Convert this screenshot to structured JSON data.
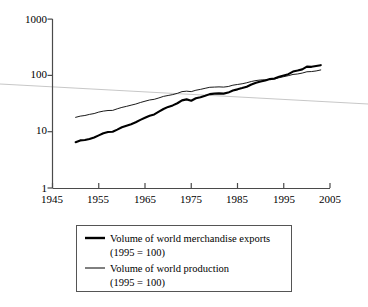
{
  "chart_data": {
    "type": "line",
    "title": "",
    "subtitle": "",
    "xlabel": "",
    "ylabel": "",
    "yscale": "log",
    "xlim": [
      1945,
      2005
    ],
    "ylim": [
      1,
      1000
    ],
    "grid": false,
    "legend_position": "bottom",
    "x_ticks": [
      "1945",
      "1955",
      "1965",
      "1975",
      "1985",
      "1995",
      "2005"
    ],
    "y_ticks": [
      "1",
      "10",
      "100",
      "1000"
    ],
    "x": [
      1950,
      1951,
      1952,
      1953,
      1954,
      1955,
      1956,
      1957,
      1958,
      1959,
      1960,
      1961,
      1962,
      1963,
      1964,
      1965,
      1966,
      1967,
      1968,
      1969,
      1970,
      1971,
      1972,
      1973,
      1974,
      1975,
      1976,
      1977,
      1978,
      1979,
      1980,
      1981,
      1982,
      1983,
      1984,
      1985,
      1986,
      1987,
      1988,
      1989,
      1990,
      1991,
      1992,
      1993,
      1994,
      1995,
      1996,
      1997,
      1998,
      1999,
      2000,
      2001,
      2002,
      2003
    ],
    "series": [
      {
        "name": "Volume of world merchandise exports (1995 = 100)",
        "style": "thick",
        "color": "#000000",
        "values": [
          6.5,
          7.0,
          7.1,
          7.4,
          7.9,
          8.6,
          9.4,
          9.9,
          10.0,
          10.9,
          12.0,
          12.8,
          13.6,
          14.7,
          16.2,
          17.7,
          19.2,
          20.3,
          22.7,
          25.3,
          27.6,
          29.3,
          32.0,
          36.0,
          37.5,
          35.5,
          39.3,
          41.0,
          43.5,
          46.5,
          47.5,
          48.0,
          47.5,
          49.5,
          54.0,
          56.5,
          59.5,
          63.0,
          69.0,
          74.0,
          78.0,
          81.0,
          86.0,
          88.0,
          95.0,
          100.0,
          105.0,
          117.0,
          122.0,
          128.0,
          143.0,
          142.0,
          147.0,
          152.0
        ]
      },
      {
        "name": "Volume of world production (1995 = 100)",
        "style": "thin",
        "color": "#000000",
        "values": [
          18.0,
          18.9,
          19.4,
          20.3,
          21.0,
          22.3,
          23.2,
          23.8,
          23.9,
          25.5,
          27.0,
          28.2,
          29.6,
          31.0,
          33.0,
          34.8,
          36.6,
          37.6,
          39.8,
          42.4,
          44.0,
          45.6,
          48.0,
          51.5,
          52.5,
          51.5,
          54.5,
          56.5,
          59.0,
          61.5,
          62.0,
          62.5,
          62.0,
          63.5,
          67.0,
          69.0,
          71.0,
          74.0,
          78.0,
          81.0,
          83.0,
          83.5,
          85.0,
          86.0,
          91.0,
          95.0,
          99.0,
          104.0,
          106.0,
          110.0,
          116.0,
          117.0,
          120.0,
          125.0
        ]
      }
    ],
    "legend_entries": [
      {
        "label_line1": "Volume of world merchandise exports",
        "label_line2": "(1995 = 100)",
        "style": "thick"
      },
      {
        "label_line1": "Volume of world production",
        "label_line2": "(1995 = 100)",
        "style": "thin"
      }
    ],
    "annotations": [
      {
        "name": "scan-artifact-line",
        "description": "faint gray diagonal streak across image"
      }
    ]
  }
}
